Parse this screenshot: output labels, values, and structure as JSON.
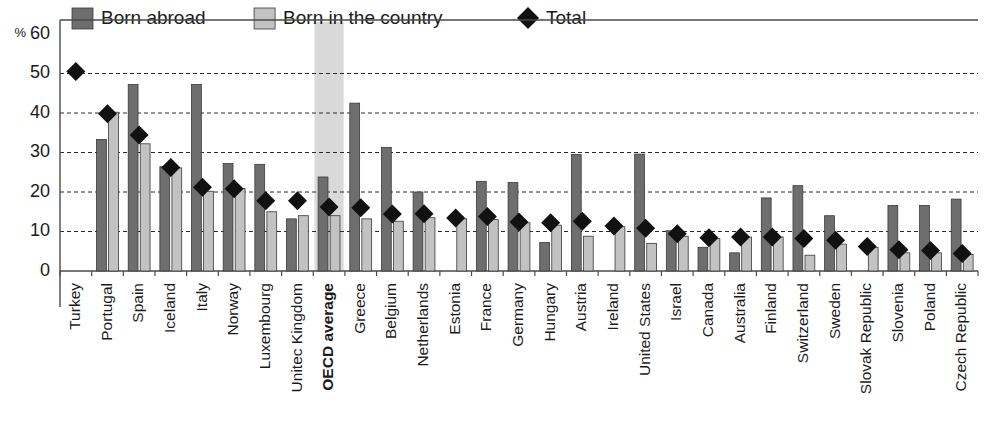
{
  "chart_data": {
    "type": "bar",
    "title": "",
    "xlabel": "",
    "ylabel": "%",
    "ylim": [
      0,
      60
    ],
    "yticks": [
      0,
      10,
      20,
      30,
      40,
      50,
      60
    ],
    "grid": true,
    "legend_position": "top",
    "highlight_category": "OECD average",
    "categories": [
      "Turkey",
      "Portugal",
      "Spain",
      "Iceland",
      "Italy",
      "Norway",
      "Luxembourg",
      "Unitec Kingdom",
      "OECD average",
      "Greece",
      "Belgium",
      "Netherlands",
      "Estonia",
      "France",
      "Germany",
      "Hungary",
      "Austria",
      "Ireland",
      "United States",
      "Israel",
      "Canada",
      "Australia",
      "Finland",
      "Switzerland",
      "Sweden",
      "Slovak Republic",
      "Slovenia",
      "Poland",
      "Czech Republic"
    ],
    "series": [
      {
        "name": "Born abroad",
        "type": "bar",
        "color": "#6e6e6e",
        "values": [
          null,
          33.3,
          47.2,
          26.4,
          47.2,
          27.2,
          27.0,
          13.2,
          23.8,
          42.5,
          31.3,
          20.0,
          null,
          22.7,
          22.4,
          7.2,
          29.5,
          null,
          29.6,
          10.2,
          6.0,
          4.6,
          18.5,
          21.6,
          14.0,
          null,
          16.6,
          16.6,
          18.2
        ]
      },
      {
        "name": "Born in the country",
        "type": "bar",
        "color": "#c2c2c2",
        "values": [
          null,
          40.2,
          32.2,
          26.1,
          20.2,
          20.9,
          15.0,
          14.0,
          14.0,
          13.2,
          12.6,
          13.5,
          13.2,
          13.0,
          12.2,
          11.6,
          8.8,
          11.2,
          7.0,
          8.8,
          8.2,
          8.6,
          8.6,
          4.0,
          6.8,
          6.0,
          4.6,
          4.6,
          4.2
        ]
      },
      {
        "name": "Total",
        "type": "marker",
        "marker": "diamond",
        "color": "#111111",
        "values": [
          50.5,
          39.8,
          34.4,
          26.2,
          21.2,
          20.8,
          17.8,
          17.8,
          16.2,
          16.0,
          14.4,
          14.5,
          13.4,
          13.8,
          12.4,
          12.2,
          12.6,
          11.4,
          10.8,
          9.4,
          8.4,
          8.6,
          8.6,
          8.2,
          7.8,
          6.2,
          5.4,
          5.2,
          4.4
        ]
      }
    ]
  },
  "legend": {
    "items": [
      {
        "label": "Born abroad",
        "swatch": "dark-gray-square",
        "color": "#6e6e6e"
      },
      {
        "label": "Born in the country",
        "swatch": "light-gray-square",
        "color": "#c2c2c2"
      },
      {
        "label": "Total",
        "swatch": "black-diamond",
        "color": "#111111"
      }
    ]
  },
  "axis": {
    "unit_label": "%",
    "y_tick_labels": [
      "60",
      "50",
      "40",
      "30",
      "20",
      "10",
      "0"
    ]
  }
}
